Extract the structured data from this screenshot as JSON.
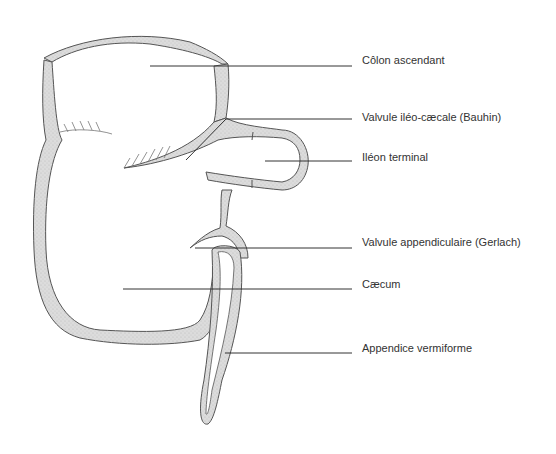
{
  "diagram": {
    "colors": {
      "wall_fill": "#d9d9d9",
      "outline": "#555555",
      "leader": "#333333",
      "label_text": "#333333"
    },
    "labels": [
      {
        "id": "colon",
        "text": "Côlon ascendant",
        "x": 362,
        "y": 54,
        "line": [
          150,
          66,
          352,
          66
        ]
      },
      {
        "id": "bauhin",
        "text": "Valvule iléo-cæcale (Bauhin)",
        "x": 362,
        "y": 111,
        "line": [
          226,
          119,
          352,
          119
        ]
      },
      {
        "id": "ileon",
        "text": "Iléon terminal",
        "x": 362,
        "y": 151,
        "line": [
          265,
          161,
          352,
          161
        ]
      },
      {
        "id": "gerlach",
        "text": "Valvule appendiculaire (Gerlach)",
        "x": 362,
        "y": 236,
        "line": [
          195,
          248,
          352,
          248
        ]
      },
      {
        "id": "caecum",
        "text": "Cæcum",
        "x": 362,
        "y": 278,
        "line": [
          123,
          289,
          352,
          289
        ]
      },
      {
        "id": "appendice",
        "text": "Appendice vermiforme",
        "x": 362,
        "y": 342,
        "line": [
          225,
          353,
          352,
          353
        ]
      }
    ]
  }
}
